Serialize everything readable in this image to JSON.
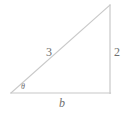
{
  "figure": {
    "type": "right-triangle-diagram",
    "stroke_color": "#c8c8c8",
    "label_color": "#6f6f6f",
    "background_color": "#ffffff",
    "vertices": {
      "left": {
        "x": 11,
        "y": 93
      },
      "bottom_right": {
        "x": 110,
        "y": 93
      },
      "apex": {
        "x": 110,
        "y": 5
      }
    },
    "labels": {
      "hypotenuse": "3",
      "opposite": "2",
      "base": "b",
      "angle": "θ"
    }
  }
}
